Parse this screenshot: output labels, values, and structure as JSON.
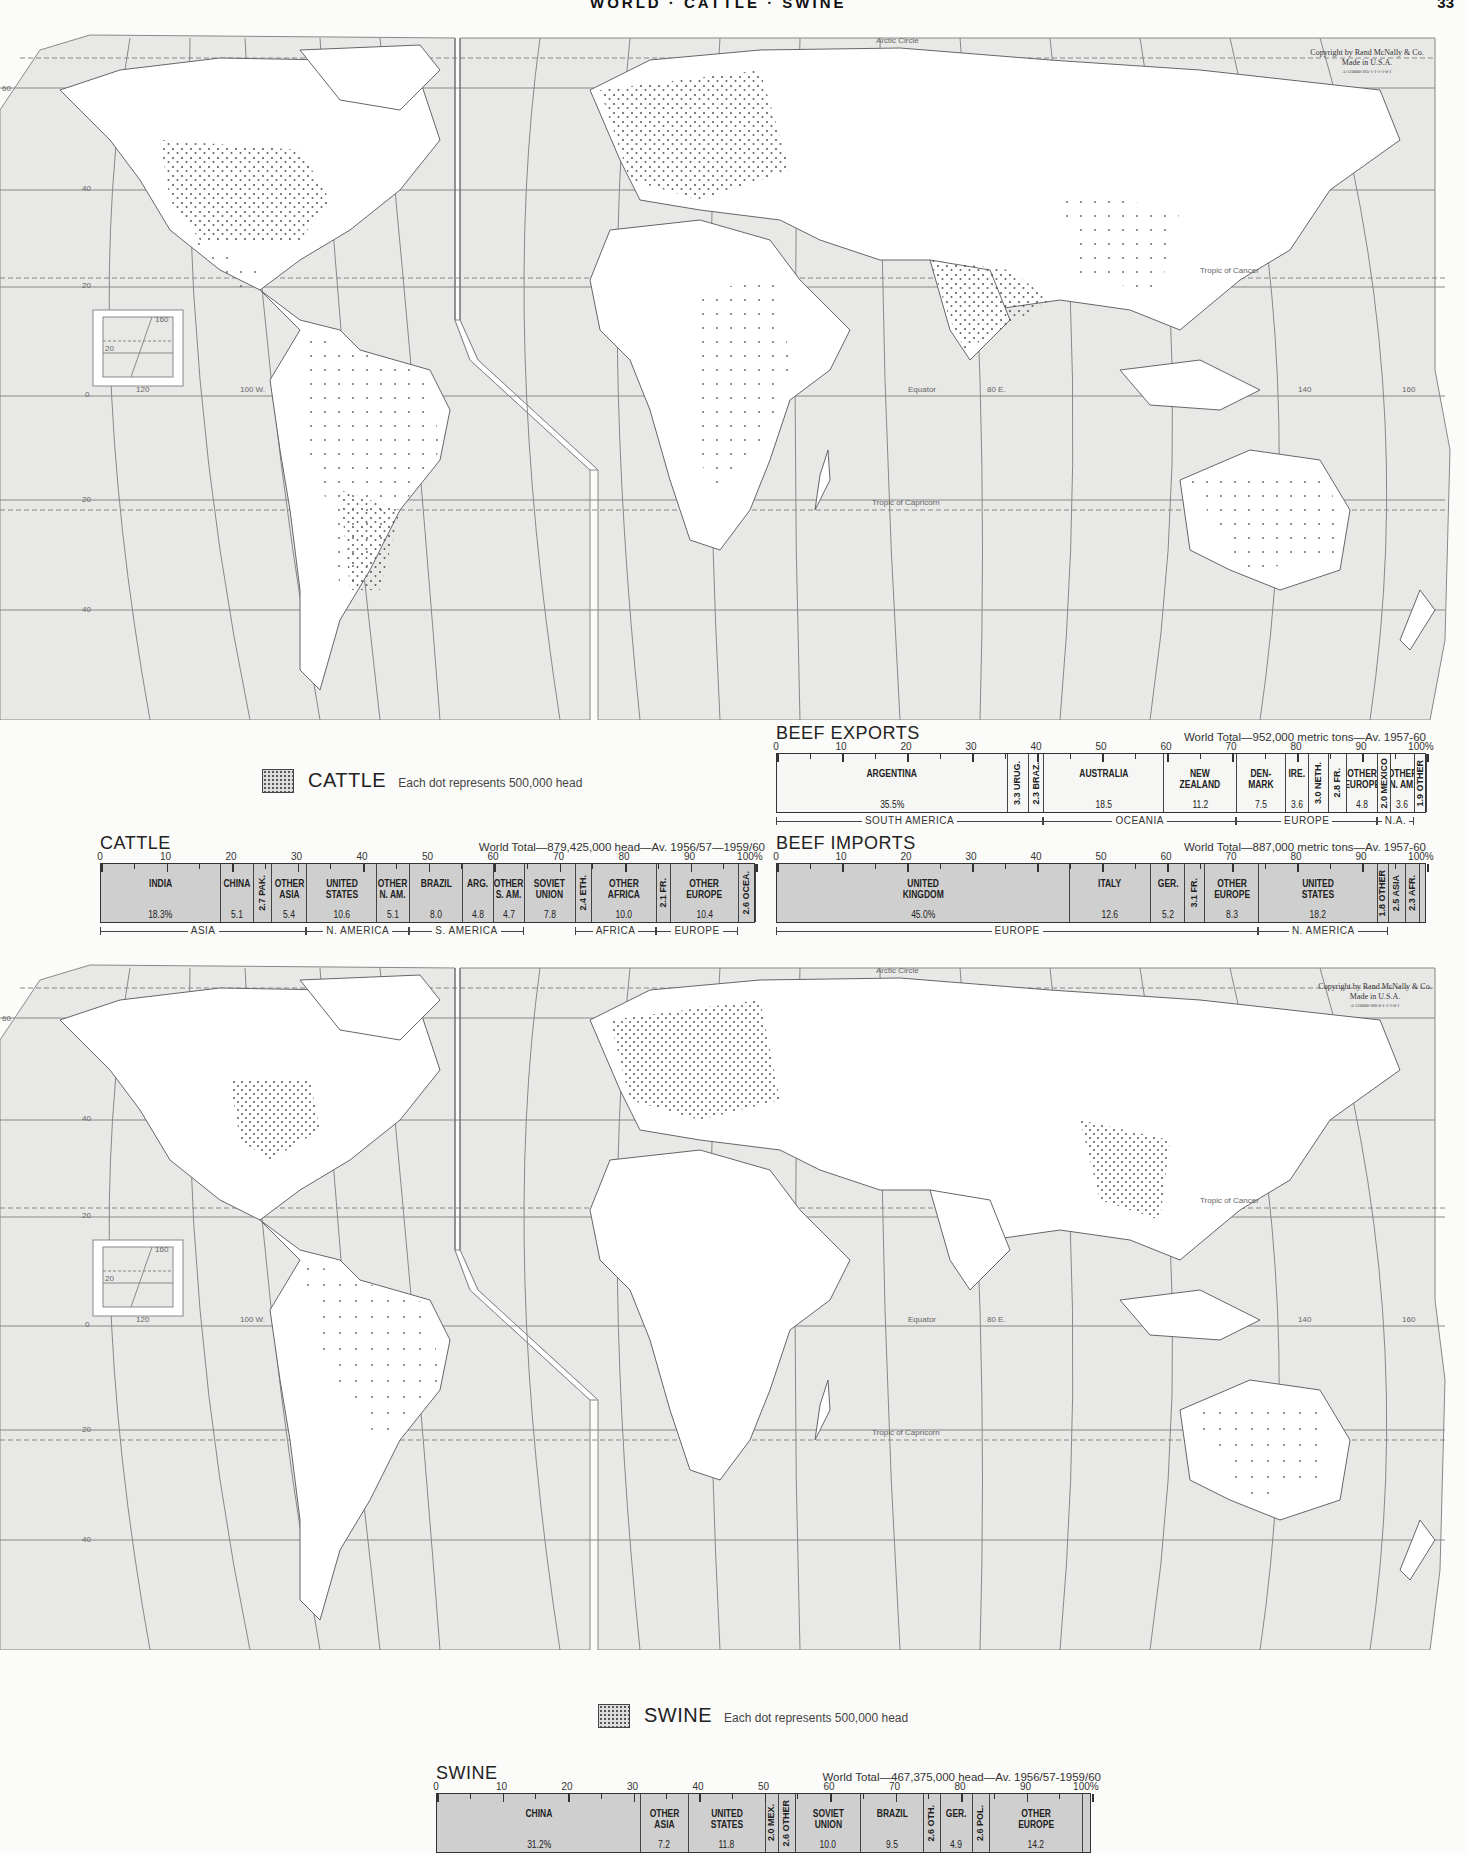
{
  "page": {
    "running_head": "WORLD · CATTLE · SWINE",
    "page_number": "33"
  },
  "maps": [
    {
      "id": "cattle-map",
      "copyright": [
        "Copyright by Rand McNally & Co.",
        "Made in U.S.A.",
        "A-510000-365-1-1-1-1-0-1"
      ],
      "labels": {
        "arctic": "Arctic Circle",
        "cancer": "Tropic of Cancer",
        "equator": "Equator",
        "capricorn": "Tropic of Capricorn",
        "lon_120": "120",
        "lon_100w": "100 W.",
        "lon_80e": "80 E.",
        "lon_140": "140",
        "lon_160": "160",
        "inset_160": "160",
        "inset_20": "20",
        "lat_60": "60",
        "lat_40": "40",
        "lat_20": "20",
        "lat_0": "0"
      },
      "legend": {
        "name": "CATTLE",
        "description": "Each dot represents 500,000 head"
      }
    },
    {
      "id": "swine-map",
      "copyright": [
        "Copyright by Rand McNally & Co.",
        "Made in U.S.A.",
        "A-510000-366-0-1-1-1-0-1"
      ],
      "labels": {
        "arctic": "Arctic Circle",
        "cancer": "Tropic of Cancer",
        "equator": "Equator",
        "capricorn": "Tropic of Capricorn",
        "lon_120": "120",
        "lon_100w": "100 W.",
        "lon_80e": "80 E.",
        "lon_140": "140",
        "lon_160": "160",
        "inset_160": "160",
        "inset_20": "20",
        "lat_60": "60",
        "lat_40": "40",
        "lat_20": "20",
        "lat_0": "0"
      },
      "legend": {
        "name": "SWINE",
        "description": "Each dot represents 500,000 head"
      }
    }
  ],
  "chart_data": [
    {
      "type": "bar",
      "stacked": true,
      "title": "CATTLE",
      "subtitle": "World Total—879,425,000 head—Av. 1956/57—1959/60",
      "unit": "%",
      "xlim": [
        0,
        100
      ],
      "ticks": [
        "0",
        "10",
        "20",
        "30",
        "40",
        "50",
        "60",
        "70",
        "80",
        "90",
        "100%"
      ],
      "categories": [
        "INDIA",
        "CHINA",
        "PAK.",
        "OTHER ASIA",
        "UNITED STATES",
        "OTHER N. AM.",
        "BRAZIL",
        "ARG.",
        "OTHER S. AM.",
        "SOVIET UNION",
        "ETH.",
        "OTHER AFRICA",
        "FR.",
        "OTHER EUROPE",
        "OCEA."
      ],
      "values": [
        18.3,
        5.1,
        2.7,
        5.4,
        10.6,
        5.1,
        8.0,
        4.8,
        4.7,
        7.8,
        2.4,
        10.0,
        2.1,
        10.4,
        2.6
      ],
      "value_labels": [
        "18.3%",
        "5.1",
        "2.7",
        "5.4",
        "10.6",
        "5.1",
        "8.0",
        "4.8",
        "4.7",
        "7.8",
        "2.4",
        "10.0",
        "2.1",
        "10.4",
        "2.6"
      ],
      "regions": [
        {
          "name": "ASIA",
          "start": 0,
          "end": 31.5
        },
        {
          "name": "N. AMERICA",
          "start": 31.5,
          "end": 47.2
        },
        {
          "name": "S. AMERICA",
          "start": 47.2,
          "end": 64.7
        },
        {
          "name": "AFRICA",
          "start": 72.5,
          "end": 84.9
        },
        {
          "name": "EUROPE",
          "start": 84.9,
          "end": 97.4
        }
      ]
    },
    {
      "type": "bar",
      "stacked": true,
      "title": "BEEF EXPORTS",
      "subtitle": "World Total—952,000 metric tons—Av. 1957-60",
      "unit": "%",
      "xlim": [
        0,
        100
      ],
      "ticks": [
        "0",
        "10",
        "20",
        "30",
        "40",
        "50",
        "60",
        "70",
        "80",
        "90",
        "100%"
      ],
      "categories": [
        "ARGENTINA",
        "URUG.",
        "BRAZ.",
        "AUSTRALIA",
        "NEW ZEALAND",
        "DEN-MARK",
        "IRE.",
        "NETH.",
        "FR.",
        "OTHER EUROPE",
        "MEXICO",
        "OTHER N. AM.",
        "OTHER"
      ],
      "values": [
        35.5,
        3.3,
        2.3,
        18.5,
        11.2,
        7.5,
        3.6,
        3.0,
        2.8,
        4.8,
        2.0,
        3.6,
        1.9
      ],
      "value_labels": [
        "35.5%",
        "3.3",
        "2.3",
        "18.5",
        "11.2",
        "7.5",
        "3.6",
        "3.0",
        "2.8",
        "4.8",
        "2.0",
        "3.6",
        "1.9"
      ],
      "regions": [
        {
          "name": "SOUTH AMERICA",
          "start": 0,
          "end": 41.1
        },
        {
          "name": "OCEANIA",
          "start": 41.1,
          "end": 70.8
        },
        {
          "name": "EUROPE",
          "start": 70.8,
          "end": 92.5
        },
        {
          "name": "N.A.",
          "start": 92.5,
          "end": 98.1
        }
      ]
    },
    {
      "type": "bar",
      "stacked": true,
      "title": "BEEF IMPORTS",
      "subtitle": "World Total—887,000 metric tons—Av. 1957-60",
      "unit": "%",
      "xlim": [
        0,
        100
      ],
      "ticks": [
        "0",
        "10",
        "20",
        "30",
        "40",
        "50",
        "60",
        "70",
        "80",
        "90",
        "100%"
      ],
      "categories": [
        "UNITED KINGDOM",
        "ITALY",
        "GER.",
        "FR.",
        "OTHER EUROPE",
        "UNITED STATES",
        "OTHER",
        "ASIA",
        "AFR."
      ],
      "values": [
        45.0,
        12.6,
        5.2,
        3.1,
        8.3,
        18.2,
        1.8,
        2.5,
        2.3
      ],
      "value_labels": [
        "45.0%",
        "12.6",
        "5.2",
        "3.1",
        "8.3",
        "18.2",
        "1.8",
        "2.5",
        "2.3"
      ],
      "regions": [
        {
          "name": "EUROPE",
          "start": 0,
          "end": 74.2
        },
        {
          "name": "N. AMERICA",
          "start": 74.2,
          "end": 94.2
        }
      ]
    },
    {
      "type": "bar",
      "stacked": true,
      "title": "SWINE",
      "subtitle": "World Total—467,375,000 head—Av. 1956/57-1959/60",
      "unit": "%",
      "xlim": [
        0,
        100
      ],
      "ticks": [
        "0",
        "10",
        "20",
        "30",
        "40",
        "50",
        "60",
        "70",
        "80",
        "90",
        "100%"
      ],
      "categories": [
        "CHINA",
        "OTHER ASIA",
        "UNITED STATES",
        "MEX.",
        "OTHER",
        "SOVIET UNION",
        "BRAZIL",
        "OTH.",
        "GER.",
        "POL.",
        "OTHER EUROPE"
      ],
      "values": [
        31.2,
        7.2,
        11.8,
        2.0,
        2.6,
        10.0,
        9.5,
        2.6,
        4.9,
        2.6,
        14.2
      ],
      "value_labels": [
        "31.2%",
        "7.2",
        "11.8",
        "2.0",
        "2.6",
        "10.0",
        "9.5",
        "2.6",
        "4.9",
        "2.6",
        "14.2"
      ],
      "regions": []
    }
  ]
}
